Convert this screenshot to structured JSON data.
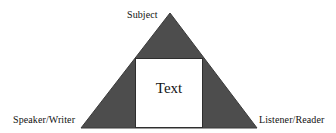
{
  "diagram": {
    "shape": {
      "name": "triangle",
      "fill_color": "#4d4d4d",
      "stroke_color": "#3a3a3a",
      "apex": {
        "x": 170,
        "y": 13
      },
      "bottom_left": {
        "x": 81,
        "y": 128
      },
      "bottom_right": {
        "x": 257,
        "y": 128
      }
    },
    "inner_box": {
      "name": "text-box",
      "fill_color": "#ffffff",
      "stroke_color": "#2e2e2e",
      "x": 135,
      "y": 58,
      "width": 67,
      "height": 69,
      "label": "Text"
    },
    "background_color": "#ffffff",
    "vertices": [
      {
        "id": "subject",
        "label": "Subject",
        "position": "top"
      },
      {
        "id": "speaker-writer",
        "label": "Speaker/Writer",
        "position": "bottom-left"
      },
      {
        "id": "listener-reader",
        "label": "Listener/Reader",
        "position": "bottom-right"
      }
    ]
  }
}
